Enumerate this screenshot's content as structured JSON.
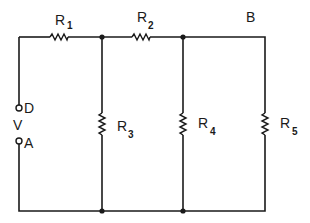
{
  "diagram": {
    "type": "circuit-schematic",
    "source": {
      "label": "V",
      "terminals": [
        "D",
        "A"
      ]
    },
    "nodes": {
      "top_right": "B"
    },
    "resistors": [
      {
        "id": "R1",
        "letter": "R",
        "sub": "1",
        "orientation": "horizontal",
        "branch": "top-left series"
      },
      {
        "id": "R2",
        "letter": "R",
        "sub": "2",
        "orientation": "horizontal",
        "branch": "top-middle series"
      },
      {
        "id": "R3",
        "letter": "R",
        "sub": "3",
        "orientation": "vertical",
        "branch": "shunt 1"
      },
      {
        "id": "R4",
        "letter": "R",
        "sub": "4",
        "orientation": "vertical",
        "branch": "shunt 2"
      },
      {
        "id": "R5",
        "letter": "R",
        "sub": "5",
        "orientation": "vertical",
        "branch": "shunt 3 (rightmost)"
      }
    ],
    "colors": {
      "ink": "#1a1a1a",
      "background": "#ffffff"
    }
  }
}
